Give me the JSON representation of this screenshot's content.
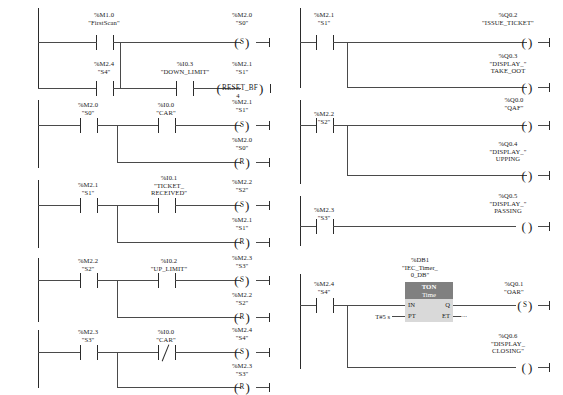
{
  "diagram": {
    "type": "ladder-logic",
    "language": "LAD",
    "colors": {
      "rail": "#2b2b2b",
      "wire": "#4a4a4a",
      "block_body": "#d9d9d9",
      "block_header": "#808080",
      "background": "#ffffff"
    }
  },
  "networks": {
    "left": [
      {
        "id": "rung-1",
        "branches": [
          {
            "contacts": [
              {
                "address": "%M1.0",
                "symbol": "\"FirstScan\"",
                "kind": "NO"
              }
            ]
          },
          {
            "contacts": [
              {
                "address": "%M2.4",
                "symbol": "\"S4\"",
                "kind": "NO"
              },
              {
                "address": "%I0.3",
                "symbol": "\"DOWN_LIMIT\"",
                "kind": "NO"
              }
            ]
          }
        ],
        "outputs": [
          {
            "address": "%M2.0",
            "symbol": "\"S0\"",
            "coil": "S"
          },
          {
            "address": "%M2.1",
            "symbol": "\"S1\"",
            "coil": "RESET_BF",
            "count": "4"
          }
        ]
      },
      {
        "id": "rung-2",
        "branches": [
          {
            "contacts": [
              {
                "address": "%M2.0",
                "symbol": "\"S0\"",
                "kind": "NO"
              },
              {
                "address": "%I0.0",
                "symbol": "\"CAR\"",
                "kind": "NO"
              }
            ]
          }
        ],
        "outputs": [
          {
            "address": "%M2.1",
            "symbol": "\"S1\"",
            "coil": "S"
          },
          {
            "address": "%M2.0",
            "symbol": "\"S0\"",
            "coil": "R"
          }
        ]
      },
      {
        "id": "rung-3",
        "branches": [
          {
            "contacts": [
              {
                "address": "%M2.1",
                "symbol": "\"S1\"",
                "kind": "NO"
              },
              {
                "address": "%I0.1",
                "symbol": "\"TICKET_",
                "symbol2": "RECEIVED\"",
                "kind": "NO"
              }
            ]
          }
        ],
        "outputs": [
          {
            "address": "%M2.2",
            "symbol": "\"S2\"",
            "coil": "S"
          },
          {
            "address": "%M2.1",
            "symbol": "\"S1\"",
            "coil": "R"
          }
        ]
      },
      {
        "id": "rung-4",
        "branches": [
          {
            "contacts": [
              {
                "address": "%M2.2",
                "symbol": "\"S2\"",
                "kind": "NO"
              },
              {
                "address": "%I0.2",
                "symbol": "\"UP_LIMIT\"",
                "kind": "NO"
              }
            ]
          }
        ],
        "outputs": [
          {
            "address": "%M2.3",
            "symbol": "\"S3\"",
            "coil": "S"
          },
          {
            "address": "%M2.2",
            "symbol": "\"S2\"",
            "coil": "R"
          }
        ]
      },
      {
        "id": "rung-5",
        "branches": [
          {
            "contacts": [
              {
                "address": "%M2.3",
                "symbol": "\"S3\"",
                "kind": "NO"
              },
              {
                "address": "%I0.0",
                "symbol": "\"CAR\"",
                "kind": "NC"
              }
            ]
          }
        ],
        "outputs": [
          {
            "address": "%M2.4",
            "symbol": "\"S4\"",
            "coil": "S"
          },
          {
            "address": "%M2.3",
            "symbol": "\"S3\"",
            "coil": "R"
          }
        ]
      }
    ],
    "right": [
      {
        "id": "rung-6",
        "branches": [
          {
            "contacts": [
              {
                "address": "%M2.1",
                "symbol": "\"S1\"",
                "kind": "NO"
              }
            ]
          }
        ],
        "outputs": [
          {
            "address": "%Q0.2",
            "symbol": "\"ISSUE_TICKET\"",
            "coil": ""
          },
          {
            "address": "%Q0.3",
            "symbol": "\"DISPLAY_\"",
            "symbol2": "TAKE_OOT",
            "coil": ""
          }
        ]
      },
      {
        "id": "rung-7",
        "branches": [
          {
            "contacts": [
              {
                "address": "%M2.2",
                "symbol": "\"S2\"",
                "kind": "NO"
              }
            ]
          }
        ],
        "outputs": [
          {
            "address": "%Q0.0",
            "symbol": "\"QAF\"",
            "coil": ""
          },
          {
            "address": "%Q0.4",
            "symbol": "\"DISPLAY_\"",
            "symbol2": "UPPING",
            "coil": ""
          }
        ]
      },
      {
        "id": "rung-8",
        "branches": [
          {
            "contacts": [
              {
                "address": "%M2.3",
                "symbol": "\"S3\"",
                "kind": "NO"
              }
            ]
          }
        ],
        "outputs": [
          {
            "address": "%Q0.5",
            "symbol": "\"DISPLAY_\"",
            "symbol2": "PASSING",
            "coil": ""
          }
        ]
      },
      {
        "id": "rung-9",
        "branches": [
          {
            "contacts": [
              {
                "address": "%M2.4",
                "symbol": "\"S4\"",
                "kind": "NO"
              }
            ]
          }
        ],
        "timer": {
          "db_address": "%DB1",
          "db_name_line1": "\"IEC_Timer_",
          "db_name_line2": "0_DB\"",
          "type": "TON",
          "time_base": "Time",
          "pins": {
            "in": "IN",
            "q": "Q",
            "pt": "PT",
            "et": "ET"
          },
          "pt_value": "T#5 s",
          "et_value": "..."
        },
        "outputs": [
          {
            "address": "%Q0.1",
            "symbol": "\"OAR\"",
            "coil": "S"
          },
          {
            "address": "%Q0.6",
            "symbol": "\"DISPLAY_",
            "symbol2": "CLOSING\"",
            "coil": ""
          }
        ]
      }
    ]
  }
}
